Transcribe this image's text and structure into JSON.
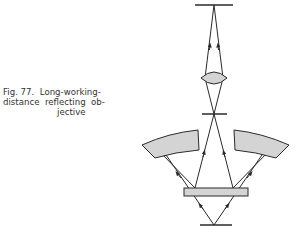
{
  "caption": {
    "figure_label": "Fig. 77.",
    "line1_rest": "Long-working-",
    "line2": "distance  reflecting  ob-",
    "line3": "jective",
    "full_text": "Fig. 77. Long-working-distance reflecting objective"
  },
  "diagram": {
    "elements": [
      "image-plane",
      "relay-lens",
      "intermediate-image",
      "left-concave-mirror",
      "right-concave-mirror",
      "plate-mirror",
      "object-plane"
    ],
    "colors": {
      "stroke": "#2a2a2a",
      "fill": "#d4d4d4"
    }
  }
}
